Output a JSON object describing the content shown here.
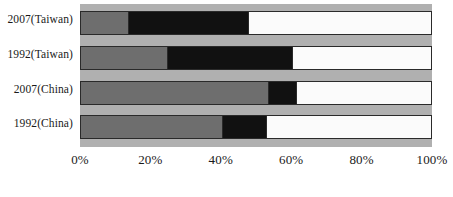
{
  "chart_data": {
    "type": "bar",
    "orientation": "horizontal",
    "stacked": true,
    "normalized_percent": true,
    "title": "",
    "xlabel": "",
    "ylabel": "",
    "xlim": [
      0,
      100
    ],
    "grid": false,
    "legend": "none",
    "categories": [
      "2007(Taiwan)",
      "1992(Taiwan)",
      "2007(China)",
      "1992(China)"
    ],
    "tick_labels": [
      "0%",
      "20%",
      "40%",
      "60%",
      "80%",
      "100%"
    ],
    "tick_values": [
      0,
      20,
      40,
      60,
      80,
      100
    ],
    "series": [
      {
        "name": "segment-1",
        "color": "#6e6e6e",
        "values": [
          13.6,
          24.7,
          53.4,
          40.3
        ]
      },
      {
        "name": "segment-2",
        "color": "#111111",
        "values": [
          34.1,
          35.5,
          8.0,
          12.5
        ]
      },
      {
        "name": "segment-3",
        "color": "#fbfbfb",
        "values": [
          52.3,
          39.8,
          38.6,
          47.2
        ]
      }
    ],
    "rows": [
      {
        "label": "2007(Taiwan)",
        "values": [
          13.6,
          34.1,
          52.3
        ]
      },
      {
        "label": "1992(Taiwan)",
        "values": [
          24.7,
          35.5,
          39.8
        ]
      },
      {
        "label": "2007(China)",
        "values": [
          53.4,
          8.0,
          38.6
        ]
      },
      {
        "label": "1992(China)",
        "values": [
          40.3,
          12.5,
          47.2
        ]
      }
    ],
    "colors": {
      "plot_background": "#b0b0b0",
      "page_background": "#ffffff",
      "segment_1": "#6e6e6e",
      "segment_2": "#111111",
      "segment_3": "#fbfbfb",
      "bar_outline": "#2a2a2a",
      "text": "#1a1a1a"
    }
  }
}
